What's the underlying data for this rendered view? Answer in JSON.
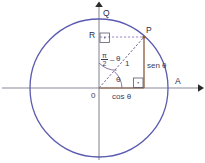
{
  "figure": {
    "type": "unit-circle-trigonometry-diagram",
    "colors": {
      "circle": "#5b5bb0",
      "axis": "#8a8a99",
      "radius": "#7a6a9a",
      "projection": "#8a5a3a",
      "dashed": "#9a8abf",
      "text": "#3c3c5a"
    }
  },
  "labels": {
    "origin": "0",
    "point_a": "A",
    "point_q": "Q",
    "point_p": "P",
    "point_r": "R",
    "radius": "1",
    "angle_theta": "θ",
    "complement_numerator": "π",
    "complement_denominator": "2",
    "complement_minus": "–",
    "complement_theta": "θ",
    "sine": "sen θ",
    "cosine": "cos θ"
  },
  "geometry": {
    "center_x": 99,
    "center_y": 88,
    "radius_px": 69,
    "point_p_x": 144,
    "point_p_y": 37,
    "angle_degrees": 48
  }
}
